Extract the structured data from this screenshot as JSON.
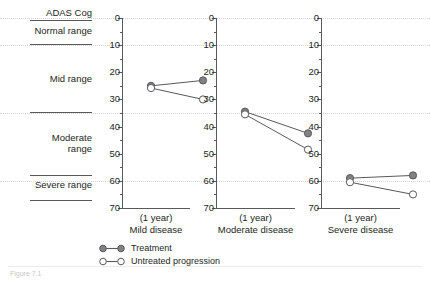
{
  "figure": {
    "axis_title": "ADAS Cog",
    "caption": "Figure 7.1"
  },
  "range_labels": [
    {
      "text": "Normal range"
    },
    {
      "text": "Mid range"
    },
    {
      "text": "Moderate\nrange"
    },
    {
      "text": "Severe range"
    }
  ],
  "legend": {
    "position": "bottom-left",
    "items": [
      {
        "label": "Treatment",
        "marker": "filled-circle",
        "color": "#808285"
      },
      {
        "label": "Untreated progression",
        "marker": "open-circle",
        "color": "#ffffff"
      }
    ]
  },
  "colors": {
    "treatment_fill": "#808285",
    "treatment_stroke": "#58595b",
    "untreated_fill": "#ffffff",
    "untreated_stroke": "#58595b",
    "axis": "#58595b",
    "grid": "#d6d4d2",
    "text": "#231f20"
  },
  "chart_data": {
    "type": "line",
    "title": "ADAS Cog",
    "xlabel": "(1 year)",
    "ylabel": "ADAS Cog",
    "ylim": [
      0,
      70
    ],
    "y_inverted": true,
    "yticks": [
      0,
      10,
      20,
      30,
      40,
      50,
      60,
      70
    ],
    "minor_tick_step": 5,
    "grid": true,
    "gridlines": [
      0,
      10,
      35,
      60
    ],
    "legend_position": "bottom-left",
    "x": [
      "baseline",
      "1 year"
    ],
    "panels": [
      {
        "name": "Mild disease",
        "xlabel": "(1 year)\nMild disease",
        "series": [
          {
            "name": "Treatment",
            "values": [
              25.0,
              23.0
            ]
          },
          {
            "name": "Untreated progression",
            "values": [
              25.8,
              30.0
            ]
          }
        ]
      },
      {
        "name": "Moderate disease",
        "xlabel": "(1 year)\nModerate disease",
        "series": [
          {
            "name": "Treatment",
            "values": [
              34.5,
              42.5
            ]
          },
          {
            "name": "Untreated progression",
            "values": [
              35.5,
              48.5
            ]
          }
        ]
      },
      {
        "name": "Severe disease",
        "xlabel": "(1 year)\nSevere disease",
        "series": [
          {
            "name": "Treatment",
            "values": [
              59.0,
              58.0
            ]
          },
          {
            "name": "Untreated progression",
            "values": [
              60.5,
              65.0
            ]
          }
        ]
      }
    ]
  },
  "axis_tick_labels": [
    "0",
    "10",
    "20",
    "30",
    "40",
    "50",
    "60",
    "70"
  ]
}
